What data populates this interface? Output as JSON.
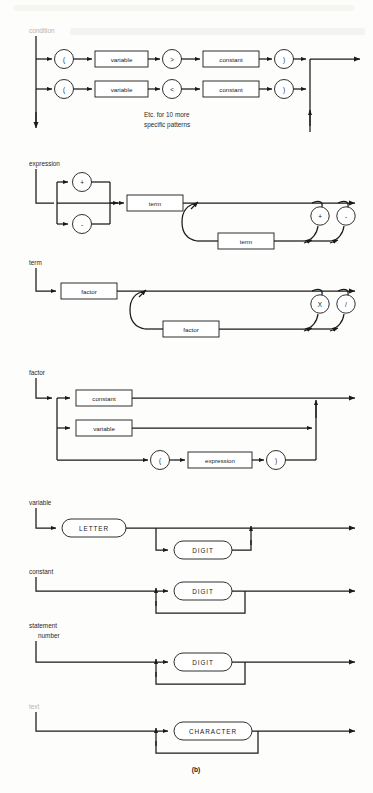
{
  "figure": {
    "caption": "(b)",
    "note_line1": "Etc. for 10 more",
    "note_line2": "specific patterns",
    "type": "syntax-railroad-diagram-set",
    "ink_color": "#1a1a1a",
    "paper_color": "#fdfdfb"
  },
  "diagrams": [
    {
      "id": "condition",
      "label": "condition",
      "label_faded": true,
      "alternatives": [
        {
          "tokens": [
            "(",
            "variable",
            ">",
            "constant",
            ")"
          ]
        },
        {
          "tokens": [
            "(",
            "variable",
            "<",
            "constant",
            ")"
          ]
        }
      ],
      "terminals": [
        "(",
        ")",
        ">",
        "<"
      ],
      "nonterminals": [
        "variable",
        "constant"
      ]
    },
    {
      "id": "expression",
      "label": "expression",
      "prefix_operators": [
        "+",
        "-"
      ],
      "body": "term",
      "repeat_operators": [
        "+",
        "-"
      ],
      "repeat_body": "term"
    },
    {
      "id": "term",
      "label": "term",
      "body": "factor",
      "repeat_operators": [
        "X",
        "/"
      ],
      "repeat_body": "factor"
    },
    {
      "id": "factor",
      "label": "factor",
      "alternatives": [
        {
          "tokens": [
            "constant"
          ]
        },
        {
          "tokens": [
            "variable"
          ]
        },
        {
          "tokens": [
            "(",
            "expression",
            ")"
          ]
        }
      ]
    },
    {
      "id": "variable",
      "label": "variable",
      "head": "LETTER",
      "repeat": "DIGIT"
    },
    {
      "id": "constant",
      "label": "constant",
      "repeat": "DIGIT"
    },
    {
      "id": "statement-number",
      "label_line1": "statement",
      "label_line2": "number",
      "repeat": "DIGIT"
    },
    {
      "id": "text",
      "label": "text",
      "label_faded": true,
      "repeat": "CHARACTER"
    }
  ],
  "tokens": {
    "lparen": "(",
    "rparen": ")",
    "gt": ">",
    "lt": "<",
    "plus": "+",
    "minus": "-",
    "times": "X",
    "divide": "/",
    "variable": "variable",
    "constant": "constant",
    "term": "term",
    "factor": "factor",
    "expression": "expression",
    "LETTER": "LETTER",
    "DIGIT": "DIGIT",
    "CHARACTER": "CHARACTER"
  }
}
